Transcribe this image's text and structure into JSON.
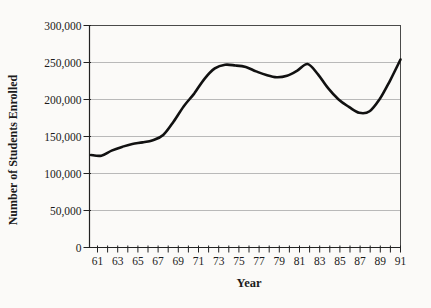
{
  "figure": {
    "background_color": "#fbfaf8",
    "text_color": "#1b1b1b",
    "frame_color": "#4a4a4a",
    "axis_color": "#222222",
    "grid_color": "#a8a8a8",
    "line_color": "#111111"
  },
  "chart_data": {
    "type": "line",
    "title": "",
    "xlabel": "Year",
    "ylabel": "Number of Students Enrolled",
    "x": [
      61,
      62,
      63,
      64,
      65,
      66,
      67,
      68,
      69,
      70,
      71,
      72,
      73,
      74,
      75,
      76,
      77,
      78,
      79,
      80,
      81,
      82,
      83,
      84,
      85,
      86,
      87,
      88,
      89,
      90,
      91
    ],
    "values": [
      125000,
      124000,
      131000,
      136000,
      140000,
      142000,
      145000,
      152000,
      170000,
      191000,
      208000,
      228000,
      242000,
      247000,
      246000,
      244000,
      238000,
      233000,
      230000,
      232000,
      239000,
      248000,
      234000,
      215000,
      200000,
      190000,
      182000,
      184000,
      201000,
      226000,
      254000
    ],
    "series_name": "Number of Students Enrolled",
    "ylim": [
      0,
      300000
    ],
    "y_ticks": [
      0,
      50000,
      100000,
      150000,
      200000,
      250000,
      300000
    ],
    "y_tick_labels": [
      "0",
      "50,000",
      "100,000",
      "150,000",
      "200,000",
      "250,000",
      "300,000"
    ],
    "x_tick_labels": [
      "61",
      "63",
      "65",
      "67",
      "69",
      "71",
      "73",
      "75",
      "77",
      "79",
      "81",
      "83",
      "85",
      "87",
      "89",
      "91"
    ],
    "grid": true,
    "legend": "none",
    "smoothed": true
  }
}
